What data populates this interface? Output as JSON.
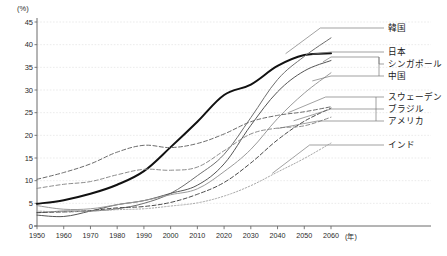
{
  "chart_data": {
    "type": "line",
    "title": "",
    "xlabel": "年",
    "ylabel": "(%)",
    "xlim": [
      1950,
      2060
    ],
    "ylim": [
      0,
      45
    ],
    "grid": true,
    "legend_position": "right-outside",
    "x": [
      1950,
      1960,
      1970,
      1980,
      1990,
      2000,
      2010,
      2020,
      2030,
      2040,
      2050,
      2060
    ],
    "xtick_labels": [
      "1950",
      "1960",
      "1970",
      "1980",
      "1990",
      "2000",
      "2010",
      "2020",
      "2030",
      "2040",
      "2050",
      "2060"
    ],
    "ytick_labels": [
      "0",
      "5",
      "10",
      "15",
      "20",
      "25",
      "30",
      "35",
      "40",
      "45"
    ],
    "ytick_values": [
      0,
      5,
      10,
      15,
      20,
      25,
      30,
      35,
      40,
      45
    ],
    "series": [
      {
        "name": "日本",
        "label": "日本",
        "style": "solid",
        "width": 2.0,
        "color": "#111111",
        "values": [
          4.9,
          5.7,
          7.1,
          9.1,
          12.1,
          17.4,
          23.0,
          28.9,
          31.2,
          35.3,
          37.7,
          38.1
        ]
      },
      {
        "name": "韓国",
        "label": "韓国",
        "style": "solid",
        "width": 1.0,
        "color": "#6e6e6e",
        "values": [
          2.9,
          3.3,
          3.3,
          3.8,
          5.0,
          7.2,
          11.1,
          15.8,
          23.9,
          32.3,
          37.4,
          41.5
        ]
      },
      {
        "name": "シンガポール",
        "label": "シンガポール",
        "style": "solid",
        "width": 1.0,
        "color": "#555555",
        "values": [
          2.4,
          2.1,
          3.3,
          4.7,
          5.6,
          7.2,
          9.0,
          13.7,
          22.2,
          29.6,
          34.2,
          36.5
        ]
      },
      {
        "name": "中国",
        "label": "中国",
        "style": "solid",
        "width": 1.0,
        "color": "#9a9a9a",
        "values": [
          4.5,
          3.7,
          3.8,
          4.7,
          5.6,
          6.9,
          8.2,
          12.0,
          16.9,
          23.7,
          29.3,
          33.8
        ]
      },
      {
        "name": "スウェーデン",
        "label": "スウェーデン",
        "style": "dashed",
        "width": 1.0,
        "color": "#6a6a6a",
        "values": [
          10.3,
          11.8,
          13.7,
          16.3,
          17.8,
          17.3,
          18.2,
          20.3,
          23.0,
          24.4,
          25.2,
          26.3
        ]
      },
      {
        "name": "ブラジル",
        "label": "ブラジル",
        "style": "dashed",
        "width": 1.0,
        "color": "#4a4a4a",
        "values": [
          3.0,
          3.1,
          3.4,
          4.0,
          4.3,
          5.2,
          7.0,
          9.6,
          13.9,
          19.0,
          23.1,
          26.0
        ]
      },
      {
        "name": "アメリカ",
        "label": "アメリカ",
        "style": "dashed",
        "width": 1.0,
        "color": "#8c8c8c",
        "values": [
          8.3,
          9.2,
          9.8,
          11.3,
          12.5,
          12.3,
          13.0,
          16.6,
          20.3,
          21.6,
          22.1,
          24.0
        ]
      },
      {
        "name": "インド",
        "label": "インド",
        "style": "dotted",
        "width": 1.0,
        "color": "#a8a8a8",
        "values": [
          3.3,
          3.1,
          3.3,
          3.6,
          3.8,
          4.4,
          5.1,
          6.6,
          8.9,
          11.9,
          14.9,
          18.3
        ]
      }
    ]
  },
  "axis": {
    "y_unit": "(%)",
    "x_unit": "(年)"
  },
  "legend": [
    {
      "label": "韓国"
    },
    {
      "label": "日本"
    },
    {
      "label": "シンガポール"
    },
    {
      "label": "中国"
    },
    {
      "label": "スウェーデン"
    },
    {
      "label": "ブラジル"
    },
    {
      "label": "アメリカ"
    },
    {
      "label": "インド"
    }
  ]
}
